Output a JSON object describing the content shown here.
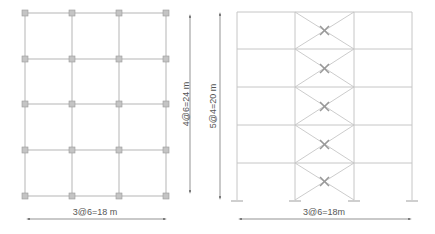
{
  "plan": {
    "width_label": "3@6=18 m",
    "height_label": "4@6=24 m",
    "bays_x": 3,
    "bays_y": 4,
    "line_color": "#b0b0b0",
    "column_color": "#bdbdbd"
  },
  "elevation": {
    "width_label": "3@6=18m",
    "height_label": "5@4=20 m",
    "bays": 3,
    "stories": 5,
    "braced_bay": 2,
    "line_color": "#c0c0c0",
    "damper_color": "#999999"
  }
}
